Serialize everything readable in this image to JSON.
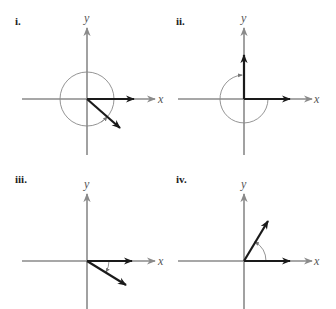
{
  "figure": {
    "panels": [
      {
        "label": "i.",
        "x_label": "x",
        "y_label": "y",
        "description": "Initial side on positive x-axis; terminal side in quadrant IV; angle greater than 360° measured counterclockwise (full circle plus)."
      },
      {
        "label": "ii.",
        "x_label": "x",
        "y_label": "y",
        "description": "Initial side on positive x-axis; terminal side on positive y-axis; angle measured clockwise (-270°)."
      },
      {
        "label": "iii.",
        "x_label": "x",
        "y_label": "y",
        "description": "Initial side on positive x-axis; terminal side in quadrant IV; small clockwise (negative) angle."
      },
      {
        "label": "iv.",
        "x_label": "x",
        "y_label": "y",
        "description": "Initial side on positive x-axis; terminal side in quadrant I; counterclockwise positive acute angle."
      }
    ],
    "colors": {
      "axis": "#8a8a8a",
      "vector": "#1a1a1a",
      "arc": "#888888",
      "label": "#222222"
    }
  }
}
